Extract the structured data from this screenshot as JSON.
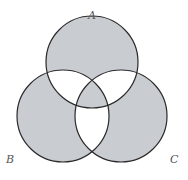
{
  "diagram": {
    "type": "venn-3-set",
    "sets": [
      {
        "id": "A",
        "label": "A",
        "cx": 92,
        "cy": 62,
        "r": 46
      },
      {
        "id": "B",
        "label": "B",
        "cx": 63,
        "cy": 116,
        "r": 46
      },
      {
        "id": "C",
        "label": "C",
        "cx": 121,
        "cy": 116,
        "r": 46
      }
    ],
    "shaded_regions": [
      "A only",
      "B only",
      "C only",
      "A∩B∩C"
    ],
    "unshaded_regions": [
      "A∩B only",
      "A∩C only",
      "B∩C only"
    ],
    "colors": {
      "shade": "#c9ccd1",
      "stroke": "#2b2b2b",
      "background": "#ffffff",
      "label": "#555555"
    }
  }
}
